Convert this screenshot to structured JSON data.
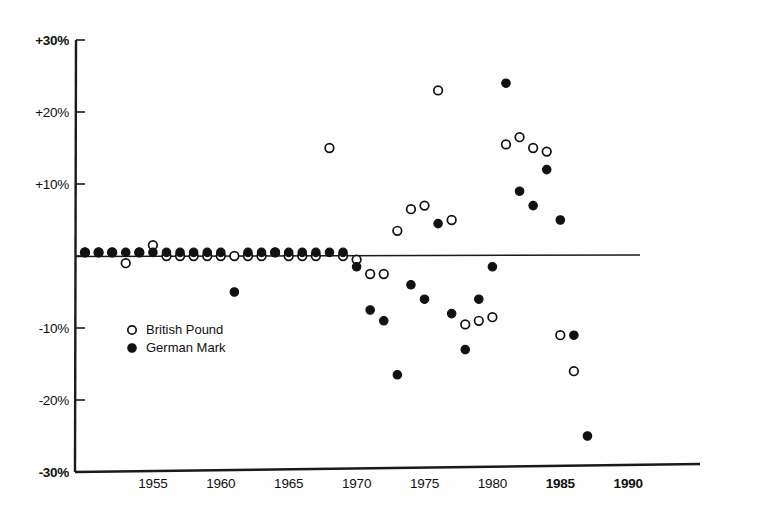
{
  "chart_data": {
    "type": "scatter",
    "title": "",
    "subtitle": "",
    "xlabel": "",
    "ylabel": "",
    "xlim": [
      1949,
      1994
    ],
    "ylim": [
      -30,
      30
    ],
    "grid": false,
    "zero_reference_line": true,
    "y_ticks": [
      {
        "value": 30,
        "label": "+30%"
      },
      {
        "value": 20,
        "label": "+20%"
      },
      {
        "value": 10,
        "label": "+10%"
      },
      {
        "value": -10,
        "label": "-10%"
      },
      {
        "value": -20,
        "label": "-20%"
      },
      {
        "value": -30,
        "label": "-30%"
      }
    ],
    "x_ticks": [
      {
        "value": 1955,
        "label": "1955",
        "bold": false
      },
      {
        "value": 1960,
        "label": "1960",
        "bold": false
      },
      {
        "value": 1965,
        "label": "1965",
        "bold": false
      },
      {
        "value": 1970,
        "label": "1970",
        "bold": false
      },
      {
        "value": 1975,
        "label": "1975",
        "bold": false
      },
      {
        "value": 1980,
        "label": "1980",
        "bold": false
      },
      {
        "value": 1985,
        "label": "1985",
        "bold": true
      },
      {
        "value": 1990,
        "label": "1990",
        "bold": true
      }
    ],
    "legend": {
      "position": "inside-left-lower",
      "entries": [
        {
          "name": "British Pound",
          "marker": "open-circle",
          "color": "#111111"
        },
        {
          "name": "German Mark",
          "marker": "filled-circle",
          "color": "#111111"
        }
      ]
    },
    "series": [
      {
        "name": "British Pound",
        "marker": "open-circle",
        "x": [
          1950,
          1951,
          1952,
          1953,
          1954,
          1955,
          1956,
          1957,
          1958,
          1959,
          1960,
          1961,
          1962,
          1963,
          1964,
          1965,
          1966,
          1967,
          1968,
          1969,
          1970,
          1971,
          1972,
          1973,
          1974,
          1975,
          1976,
          1977,
          1978,
          1979,
          1980,
          1981,
          1982,
          1983,
          1984,
          1985,
          1986,
          1987
        ],
        "y": [
          0.5,
          0.5,
          0.5,
          -1,
          0.5,
          1.5,
          0,
          0,
          0,
          0,
          0,
          0,
          0,
          0,
          0.5,
          0,
          0,
          0,
          15,
          0,
          -0.5,
          -2.5,
          -2.5,
          3.5,
          6.5,
          7,
          23,
          5,
          -9.5,
          -9,
          -8.5,
          15.5,
          16.5,
          15,
          14.5,
          -11,
          -16,
          null
        ]
      },
      {
        "name": "German Mark",
        "marker": "filled-circle",
        "x": [
          1950,
          1951,
          1952,
          1953,
          1954,
          1955,
          1956,
          1957,
          1958,
          1959,
          1960,
          1961,
          1962,
          1963,
          1964,
          1965,
          1966,
          1967,
          1968,
          1969,
          1970,
          1971,
          1972,
          1973,
          1974,
          1975,
          1976,
          1977,
          1978,
          1979,
          1980,
          1981,
          1982,
          1983,
          1984,
          1985,
          1986,
          1987
        ],
        "y": [
          0.5,
          0.5,
          0.5,
          0.5,
          0.5,
          0.5,
          0.5,
          0.5,
          0.5,
          0.5,
          0.5,
          -5,
          0.5,
          0.5,
          0.5,
          0.5,
          0.5,
          0.5,
          0.5,
          0.5,
          -1.5,
          -7.5,
          -9,
          -16.5,
          -4,
          -6,
          4.5,
          -8,
          -13,
          -6,
          -1.5,
          24,
          9,
          7,
          12,
          5,
          -11,
          -25
        ]
      }
    ],
    "notable_points": [
      {
        "series": "British Pound",
        "year": 1968,
        "value": 15
      },
      {
        "series": "British Pound",
        "year": 1976,
        "value": 23
      },
      {
        "series": "German Mark",
        "year": 1981,
        "value": 24
      },
      {
        "series": "German Mark",
        "year": 1973,
        "value": -16.5
      },
      {
        "series": "German Mark",
        "year": 1987,
        "value": -25
      },
      {
        "series": "British Pound",
        "year": 1987,
        "value": -16
      }
    ]
  },
  "geometry": {
    "plot_left": 76,
    "plot_right": 700,
    "y_zero_px": 256,
    "px_per_10pct": 72,
    "x_1950_px": 85,
    "px_per_year": 13.58,
    "zero_line_x_end": 640
  },
  "legend_block": {
    "british_pound": "British Pound",
    "german_mark": "German Mark"
  }
}
